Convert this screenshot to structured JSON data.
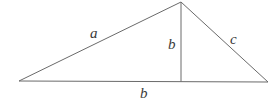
{
  "diagram": {
    "type": "triangle-with-altitude",
    "stroke_color": "#6a6a6a",
    "label_color": "#3a3a3a",
    "vertices": {
      "left": [
        19,
        81
      ],
      "apex": [
        181,
        2
      ],
      "right": [
        268,
        82
      ],
      "foot": [
        181,
        81.5
      ]
    },
    "labels": {
      "side_a": {
        "text": "a",
        "x": 94,
        "y": 38
      },
      "altitude_b": {
        "text": "b",
        "x": 172,
        "y": 49
      },
      "side_c": {
        "text": "c",
        "x": 234,
        "y": 44
      },
      "base_b": {
        "text": "b",
        "x": 144,
        "y": 98
      }
    }
  }
}
